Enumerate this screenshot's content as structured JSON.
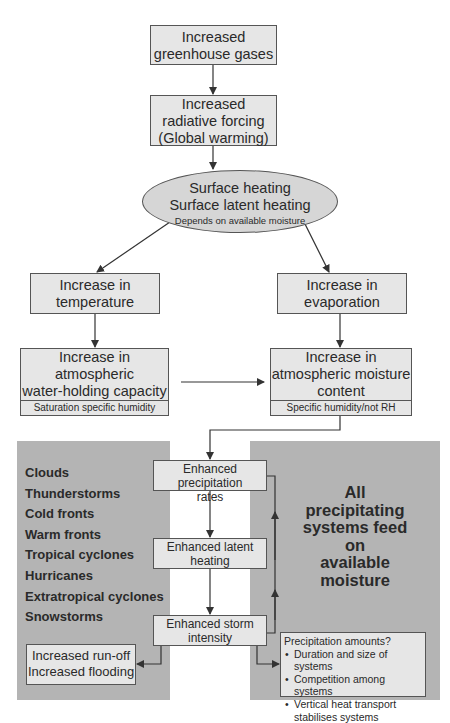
{
  "top": {
    "greenhouse": {
      "line1": "Increased",
      "line2": "greenhouse gases"
    },
    "forcing": {
      "line1": "Increased",
      "line2": "radiative forcing",
      "line3": "(Global warming)"
    },
    "surface": {
      "line1": "Surface heating",
      "line2": "Surface latent heating",
      "note": "Depends on available moisture"
    }
  },
  "left_branch": {
    "temperature": {
      "line1": "Increase in",
      "line2": "temperature"
    },
    "capacity": {
      "line1": "Increase in",
      "line2": "atmospheric",
      "line3": "water-holding capacity",
      "sub": "Saturation specific humidity"
    }
  },
  "right_branch": {
    "evaporation": {
      "line1": "Increase in",
      "line2": "evaporation"
    },
    "moisture": {
      "line1": "Increase in",
      "line2": "atmospheric moisture",
      "line3": "content",
      "sub": "Specific humidity/not RH"
    }
  },
  "center_chain": {
    "precip_rates": {
      "line1": "Enhanced precipitation",
      "line2": "rates"
    },
    "latent": {
      "line1": "Enhanced latent",
      "line2": "heating"
    },
    "storm": {
      "line1": "Enhanced storm",
      "line2": "intensity"
    }
  },
  "systems": [
    "Clouds",
    "Thunderstorms",
    "Cold fronts",
    "Warm fronts",
    "Tropical cyclones",
    "Hurricanes",
    "Extratropical cyclones",
    "Snowstorms"
  ],
  "feed_text": {
    "l1": "All",
    "l2": "precipitating",
    "l3": "systems feed",
    "l4": "on",
    "l5": "available",
    "l6": "moisture"
  },
  "runoff": {
    "line1": "Increased run-off",
    "line2": "Increased flooding"
  },
  "amounts": {
    "title": "Precipitation amounts?",
    "bullets": [
      "Duration and size of systems",
      "Competition among systems",
      "Vertical heat transport stabilises systems"
    ]
  },
  "colors": {
    "box_fill": "#e6e6e6",
    "panel_fill": "#b4b4b4",
    "ellipse_fill": "#d6d6d6",
    "line": "#333333"
  }
}
